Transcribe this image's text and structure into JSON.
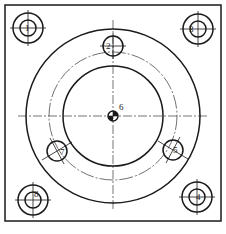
{
  "drawing": {
    "type": "flange-plate-top-view",
    "colors": {
      "line": "#1a1a1a",
      "background": "#ffffff"
    },
    "border": {
      "x": 5,
      "y": 5,
      "width": 216,
      "height": 216
    },
    "center": {
      "x": 113,
      "y": 116
    },
    "circles": {
      "outer_radius": 87,
      "pitch_radius": 64,
      "inner_radius": 50
    },
    "center_mark": {
      "label": "6",
      "radius": 5
    },
    "holes": [
      {
        "label": "2",
        "x": 113,
        "y": 46,
        "r": 10
      },
      {
        "label": "5",
        "x": 173,
        "y": 150,
        "r": 10
      },
      {
        "label": "7",
        "x": 57,
        "y": 151,
        "r": 10
      }
    ],
    "corner_bosses": [
      {
        "label": "1",
        "x": 28,
        "y": 28,
        "outer_r": 15,
        "inner_r": 8
      },
      {
        "label": "3",
        "x": 198,
        "y": 29,
        "outer_r": 15,
        "inner_r": 8
      },
      {
        "label": "8",
        "x": 33,
        "y": 200,
        "outer_r": 15,
        "inner_r": 8
      },
      {
        "label": "4",
        "x": 197,
        "y": 197,
        "outer_r": 15,
        "inner_r": 8
      }
    ]
  }
}
